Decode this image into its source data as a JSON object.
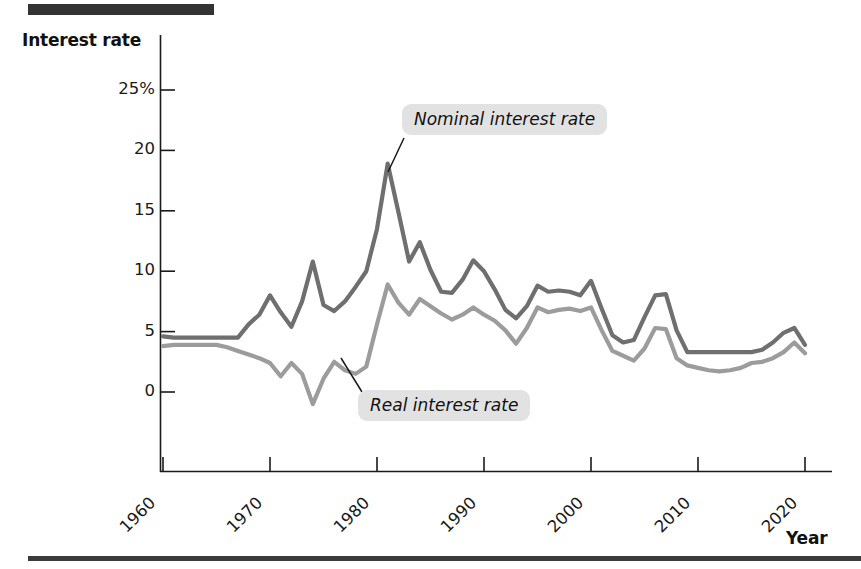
{
  "figure": {
    "y_axis_title": "Interest rate",
    "x_axis_title": "Year",
    "annotations": {
      "nominal_label": "Nominal interest rate",
      "real_label": "Real interest rate"
    },
    "colors": {
      "nominal_line": "#6f6f6f",
      "real_line": "#9c9c9c",
      "axis": "#1a1a1a",
      "callout_background": "#e2e2e2",
      "rule": "#333333"
    }
  },
  "chart_data": {
    "type": "line",
    "title": "",
    "subtitle": "",
    "xlabel": "Year",
    "ylabel": "Interest rate",
    "xlim": [
      1960,
      2020
    ],
    "ylim": [
      -2,
      25
    ],
    "ytick_labels": [
      "25%",
      "20",
      "15",
      "10",
      "5",
      "0"
    ],
    "ytick_values": [
      25,
      20,
      15,
      10,
      5,
      0
    ],
    "xtick_labels": [
      "1960",
      "1970",
      "1980",
      "1990",
      "2000",
      "2010",
      "2020"
    ],
    "xtick_values": [
      1960,
      1970,
      1980,
      1990,
      2000,
      2010,
      2020
    ],
    "grid": false,
    "legend_position": "inline-annotations",
    "x": [
      1960,
      1961,
      1962,
      1963,
      1964,
      1965,
      1966,
      1967,
      1968,
      1969,
      1970,
      1971,
      1972,
      1973,
      1974,
      1975,
      1976,
      1977,
      1978,
      1979,
      1980,
      1981,
      1982,
      1983,
      1984,
      1985,
      1986,
      1987,
      1988,
      1989,
      1990,
      1991,
      1992,
      1993,
      1994,
      1995,
      1996,
      1997,
      1998,
      1999,
      2000,
      2001,
      2002,
      2003,
      2004,
      2005,
      2006,
      2007,
      2008,
      2009,
      2010,
      2011,
      2012,
      2013,
      2014,
      2015,
      2016,
      2017,
      2018,
      2019,
      2020
    ],
    "series": [
      {
        "name": "Nominal interest rate",
        "color": "#6f6f6f",
        "values": [
          4.6,
          4.5,
          4.5,
          4.5,
          4.5,
          4.5,
          4.5,
          4.5,
          5.6,
          6.4,
          8.0,
          6.6,
          5.4,
          7.5,
          10.8,
          7.2,
          6.7,
          7.5,
          8.7,
          10.0,
          13.5,
          18.9,
          14.9,
          10.8,
          12.4,
          10.1,
          8.3,
          8.2,
          9.3,
          10.9,
          10.0,
          8.5,
          6.8,
          6.1,
          7.1,
          8.8,
          8.3,
          8.4,
          8.3,
          8.0,
          9.2,
          6.9,
          4.7,
          4.1,
          4.3,
          6.2,
          8.0,
          8.1,
          5.1,
          3.3,
          3.3,
          3.3,
          3.3,
          3.3,
          3.3,
          3.3,
          3.5,
          4.1,
          4.9,
          5.3,
          3.9
        ]
      },
      {
        "name": "Real interest rate",
        "color": "#9c9c9c",
        "values": [
          3.8,
          3.9,
          3.9,
          3.9,
          3.9,
          3.9,
          3.7,
          3.4,
          3.1,
          2.8,
          2.4,
          1.3,
          2.4,
          1.5,
          -1.0,
          1.1,
          2.5,
          1.8,
          1.5,
          2.1,
          5.6,
          8.9,
          7.4,
          6.4,
          7.7,
          7.1,
          6.5,
          6.0,
          6.4,
          7.0,
          6.4,
          5.9,
          5.1,
          4.0,
          5.3,
          7.0,
          6.6,
          6.8,
          6.9,
          6.7,
          7.0,
          5.1,
          3.4,
          3.0,
          2.6,
          3.6,
          5.3,
          5.2,
          2.8,
          2.2,
          2.0,
          1.8,
          1.7,
          1.8,
          2.0,
          2.4,
          2.5,
          2.8,
          3.3,
          4.1,
          3.2
        ]
      }
    ],
    "annotations": [
      {
        "text": "Nominal interest rate",
        "points_to_year": 1981,
        "points_to_value": 18.9
      },
      {
        "text": "Real interest rate",
        "points_to_year": 1978,
        "points_to_value": 2.3
      }
    ]
  }
}
